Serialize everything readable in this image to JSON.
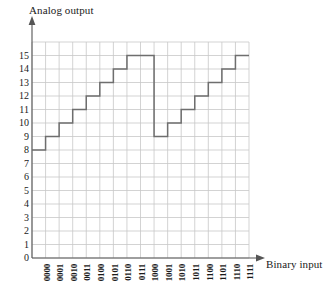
{
  "chart_data": {
    "type": "line",
    "title": "",
    "subtitle": "",
    "xlabel": "Binary input",
    "ylabel": "Analog output",
    "categories": [
      "0000",
      "0001",
      "0010",
      "0011",
      "0100",
      "0101",
      "0110",
      "0111",
      "1000",
      "1001",
      "1010",
      "1011",
      "1100",
      "1101",
      "1110",
      "1111"
    ],
    "values": [
      8,
      9,
      10,
      11,
      12,
      13,
      14,
      15,
      15,
      9,
      10,
      11,
      12,
      13,
      14,
      15
    ],
    "series": [
      {
        "name": "Analog output",
        "values": [
          8,
          9,
          10,
          11,
          12,
          13,
          14,
          15,
          15,
          9,
          10,
          11,
          12,
          13,
          14,
          15
        ]
      }
    ],
    "x_tick_labels": [
      "0000",
      "0001",
      "0010",
      "0011",
      "0100",
      "0101",
      "0110",
      "0111",
      "1000",
      "1001",
      "1010",
      "1011",
      "1100",
      "1101",
      "1110",
      "1111"
    ],
    "y_tick_labels": [
      "0",
      "1",
      "2",
      "3",
      "4",
      "5",
      "6",
      "7",
      "8",
      "9",
      "10",
      "11",
      "12",
      "13",
      "14",
      "15"
    ],
    "y_ticks": [
      0,
      1,
      2,
      3,
      4,
      5,
      6,
      7,
      8,
      9,
      10,
      11,
      12,
      13,
      14,
      15
    ],
    "ylim": [
      0,
      16
    ],
    "xlim": [
      0,
      16
    ],
    "grid": true,
    "legend": "none",
    "step_style": "post",
    "annotations": [],
    "colors": {
      "line": "#6e6e6e",
      "grid": "#c8c8c8",
      "axis": "#555555",
      "text": "#1a1a1a",
      "background": "#ffffff"
    }
  },
  "axes": {
    "y_title": "Analog output",
    "x_title": "Binary input"
  },
  "icons": {
    "y_axis_arrow": "arrow-up-icon",
    "x_axis_arrow": "arrow-right-icon"
  }
}
